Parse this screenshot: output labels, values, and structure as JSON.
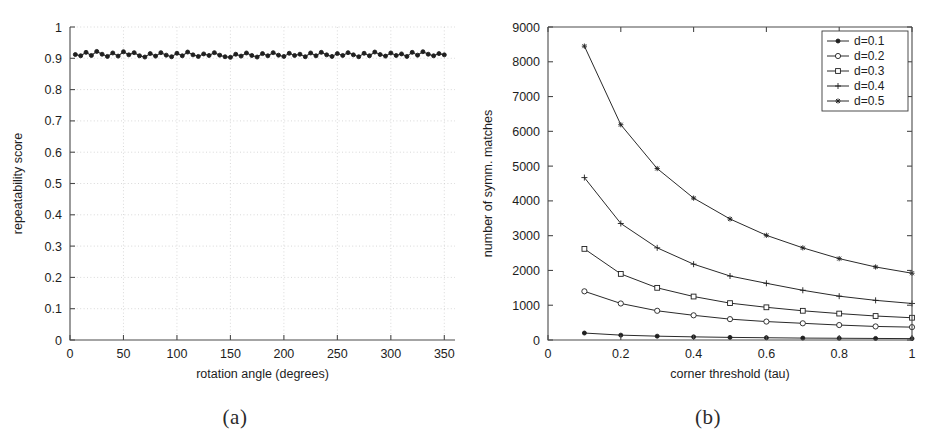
{
  "figure": {
    "panels": [
      {
        "id": "a",
        "caption": "(a)"
      },
      {
        "id": "b",
        "caption": "(b)"
      }
    ]
  },
  "chart_data": [
    {
      "type": "line",
      "panel": "a",
      "title": "",
      "xlabel": "rotation angle (degrees)",
      "ylabel": "repeatability score",
      "xlim": [
        0,
        360
      ],
      "ylim": [
        0,
        1
      ],
      "xticks": [
        0,
        50,
        100,
        150,
        200,
        250,
        300,
        350
      ],
      "xticklabels": [
        "0",
        "50",
        "100",
        "150",
        "200",
        "250",
        "300",
        "350"
      ],
      "yticks": [
        0,
        0.1,
        0.2,
        0.3,
        0.4,
        0.5,
        0.6,
        0.7,
        0.8,
        0.9,
        1
      ],
      "yticklabels": [
        "0",
        "0.1",
        "0.2",
        "0.3",
        "0.4",
        "0.5",
        "0.6",
        "0.7",
        "0.8",
        "0.9",
        "1"
      ],
      "grid": true,
      "legend": null,
      "marker": "dot",
      "series": [
        {
          "name": "repeatability",
          "x": [
            5,
            10,
            15,
            20,
            25,
            30,
            35,
            40,
            45,
            50,
            55,
            60,
            65,
            70,
            75,
            80,
            85,
            90,
            95,
            100,
            105,
            110,
            115,
            120,
            125,
            130,
            135,
            140,
            145,
            150,
            155,
            160,
            165,
            170,
            175,
            180,
            185,
            190,
            195,
            200,
            205,
            210,
            215,
            220,
            225,
            230,
            235,
            240,
            245,
            250,
            255,
            260,
            265,
            270,
            275,
            280,
            285,
            290,
            295,
            300,
            305,
            310,
            315,
            320,
            325,
            330,
            335,
            340,
            345,
            350
          ],
          "values": [
            0.912,
            0.908,
            0.919,
            0.909,
            0.922,
            0.913,
            0.906,
            0.917,
            0.907,
            0.921,
            0.911,
            0.918,
            0.908,
            0.904,
            0.915,
            0.907,
            0.918,
            0.91,
            0.905,
            0.916,
            0.908,
            0.92,
            0.911,
            0.906,
            0.914,
            0.909,
            0.918,
            0.91,
            0.905,
            0.903,
            0.913,
            0.907,
            0.917,
            0.909,
            0.904,
            0.915,
            0.908,
            0.918,
            0.91,
            0.906,
            0.916,
            0.909,
            0.913,
            0.905,
            0.917,
            0.908,
            0.919,
            0.911,
            0.906,
            0.915,
            0.909,
            0.918,
            0.911,
            0.905,
            0.916,
            0.908,
            0.92,
            0.912,
            0.907,
            0.917,
            0.909,
            0.914,
            0.906,
            0.919,
            0.91,
            0.921,
            0.913,
            0.908,
            0.915,
            0.911
          ]
        }
      ]
    },
    {
      "type": "line",
      "panel": "b",
      "title": "",
      "xlabel": "corner threshold (tau)",
      "ylabel": "number of symm. matches",
      "xlim": [
        0,
        1
      ],
      "ylim": [
        0,
        9000
      ],
      "xticks": [
        0,
        0.2,
        0.4,
        0.6,
        0.8,
        1
      ],
      "xticklabels": [
        "0",
        "0.2",
        "0.4",
        "0.6",
        "0.8",
        "1"
      ],
      "yticks": [
        0,
        1000,
        2000,
        3000,
        4000,
        5000,
        6000,
        7000,
        8000,
        9000
      ],
      "yticklabels": [
        "0",
        "1000",
        "2000",
        "3000",
        "4000",
        "5000",
        "6000",
        "7000",
        "8000",
        "9000"
      ],
      "grid": false,
      "legend": {
        "position": "top-right"
      },
      "x": [
        0.1,
        0.2,
        0.3,
        0.4,
        0.5,
        0.6,
        0.7,
        0.8,
        0.9,
        1.0
      ],
      "series": [
        {
          "name": "d=0.1",
          "marker": "dot",
          "values": [
            200,
            140,
            110,
            90,
            75,
            65,
            55,
            50,
            45,
            40
          ]
        },
        {
          "name": "d=0.2",
          "marker": "circle",
          "values": [
            1400,
            1050,
            840,
            710,
            600,
            530,
            480,
            430,
            390,
            370
          ]
        },
        {
          "name": "d=0.3",
          "marker": "square",
          "values": [
            2620,
            1900,
            1500,
            1250,
            1060,
            940,
            840,
            760,
            690,
            640
          ]
        },
        {
          "name": "d=0.4",
          "marker": "plus",
          "values": [
            4670,
            3350,
            2650,
            2180,
            1840,
            1630,
            1430,
            1260,
            1140,
            1050
          ]
        },
        {
          "name": "d=0.5",
          "marker": "star",
          "values": [
            8450,
            6190,
            4930,
            4080,
            3480,
            3010,
            2650,
            2340,
            2100,
            1920
          ]
        }
      ]
    }
  ]
}
